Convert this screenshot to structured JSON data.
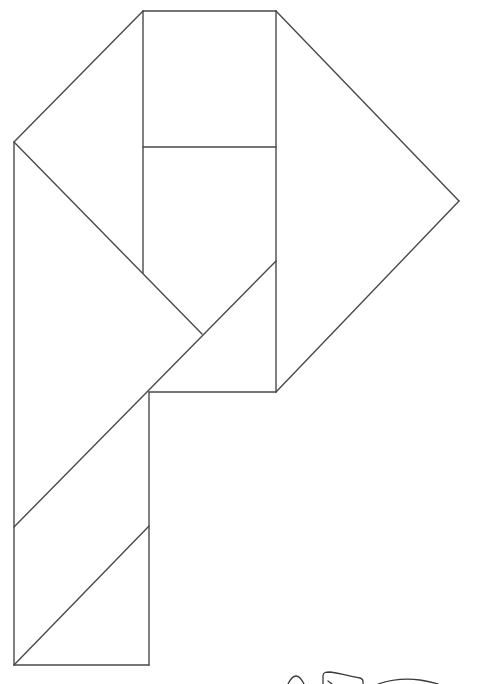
{
  "diagram": {
    "type": "tangram-outline",
    "shape": "letter P",
    "stroke_color": "#4a4a4a",
    "background": "#ffffff",
    "pieces": [
      {
        "id": "square-top",
        "kind": "square",
        "points": [
          [
            143,
            11
          ],
          [
            276,
            11
          ],
          [
            276,
            147
          ],
          [
            143,
            147
          ]
        ]
      },
      {
        "id": "triangle-left-top",
        "kind": "triangle",
        "points": [
          [
            143,
            11
          ],
          [
            14,
            142
          ],
          [
            143,
            273
          ]
        ]
      },
      {
        "id": "triangle-right-large",
        "kind": "triangle",
        "points": [
          [
            276,
            11
          ],
          [
            459,
            201
          ],
          [
            276,
            392
          ]
        ]
      },
      {
        "id": "parallelogram-mid",
        "kind": "quad",
        "points": [
          [
            143,
            147
          ],
          [
            276,
            147
          ],
          [
            276,
            261
          ],
          [
            202,
            334
          ],
          [
            143,
            273
          ]
        ]
      },
      {
        "id": "triangle-left-large",
        "kind": "triangle",
        "points": [
          [
            14,
            142
          ],
          [
            202,
            334
          ],
          [
            14,
            527
          ]
        ]
      },
      {
        "id": "triangle-small-mid",
        "kind": "triangle",
        "points": [
          [
            276,
            261
          ],
          [
            276,
            392
          ],
          [
            149,
            392
          ]
        ]
      },
      {
        "id": "parallelogram-stem",
        "kind": "parallelogram",
        "points": [
          [
            14,
            527
          ],
          [
            149,
            392
          ],
          [
            149,
            526
          ],
          [
            14,
            665
          ]
        ]
      },
      {
        "id": "triangle-bottom",
        "kind": "triangle",
        "points": [
          [
            14,
            665
          ],
          [
            149,
            526
          ],
          [
            149,
            665
          ]
        ]
      }
    ],
    "annotation": {
      "kind": "handwritten-scribble",
      "position": "bottom-right, partially cut off"
    }
  }
}
